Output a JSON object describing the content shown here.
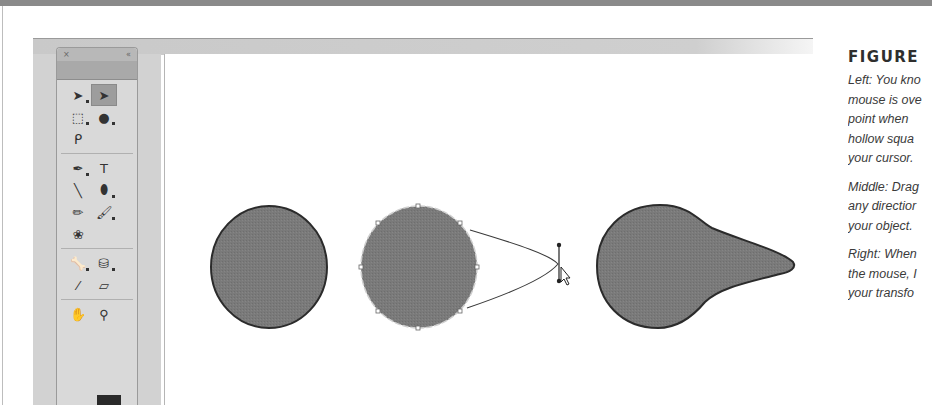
{
  "caption": {
    "title": "FIGURE",
    "paragraphs": [
      [
        "Left: You kno",
        "mouse is ove",
        "point when",
        "hollow squa",
        "your cursor."
      ],
      [
        "Middle: Drag",
        "any directior",
        "your object."
      ],
      [
        "Right: When",
        "the mouse, I",
        "your transfo"
      ]
    ]
  },
  "toolbar": {
    "header": {
      "close_glyph": "×",
      "collapse_glyph": "«"
    },
    "tool_groups": [
      [
        {
          "name": "selection-tool",
          "glyph": "➤",
          "active": false,
          "has_submenu": true
        },
        {
          "name": "subselection-tool",
          "glyph": "➤",
          "active": true,
          "has_submenu": false
        },
        {
          "name": "free-transform-tool",
          "glyph": "⬚",
          "active": false,
          "has_submenu": true
        },
        {
          "name": "3d-rotation-tool",
          "glyph": "●",
          "active": false,
          "has_submenu": true
        },
        {
          "name": "lasso-tool",
          "glyph": "ᑭ",
          "active": false,
          "has_submenu": false
        }
      ],
      [
        {
          "name": "pen-tool",
          "glyph": "✒",
          "active": false,
          "has_submenu": true
        },
        {
          "name": "text-tool",
          "glyph": "T",
          "active": false,
          "has_submenu": false
        },
        {
          "name": "line-tool",
          "glyph": "╲",
          "active": false,
          "has_submenu": false
        },
        {
          "name": "oval-tool",
          "glyph": "⬮",
          "active": false,
          "has_submenu": true
        },
        {
          "name": "pencil-tool",
          "glyph": "✏",
          "active": false,
          "has_submenu": false
        },
        {
          "name": "brush-tool",
          "glyph": "🖌",
          "active": false,
          "has_submenu": true
        },
        {
          "name": "deco-tool",
          "glyph": "❀",
          "active": false,
          "has_submenu": false
        }
      ],
      [
        {
          "name": "bone-tool",
          "glyph": "🦴",
          "active": false,
          "has_submenu": true
        },
        {
          "name": "paint-bucket-tool",
          "glyph": "⛁",
          "active": false,
          "has_submenu": true
        },
        {
          "name": "eyedropper-tool",
          "glyph": "⁄",
          "active": false,
          "has_submenu": false
        },
        {
          "name": "eraser-tool",
          "glyph": "▱",
          "active": false,
          "has_submenu": false
        }
      ],
      [
        {
          "name": "hand-tool",
          "glyph": "✋",
          "active": false,
          "has_submenu": false
        },
        {
          "name": "zoom-tool",
          "glyph": "⚲",
          "active": false,
          "has_submenu": false
        }
      ]
    ],
    "stroke_color": "#2a2a2a"
  },
  "stage": {
    "fill_color": "#7a7a7a",
    "stroke_color": "#2b2b2b",
    "shapes": [
      {
        "label": "circle-left",
        "state": "unselected"
      },
      {
        "label": "circle-middle",
        "state": "being-dragged"
      },
      {
        "label": "teardrop-right",
        "state": "transformed"
      }
    ]
  }
}
